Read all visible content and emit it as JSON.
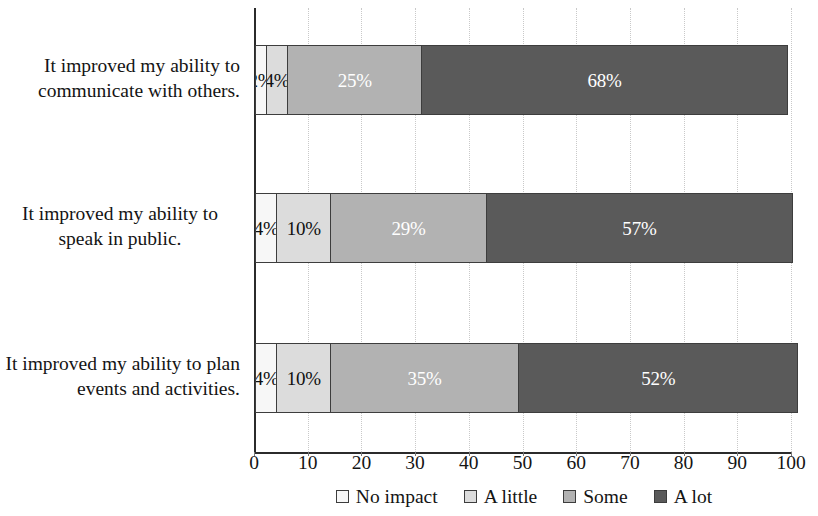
{
  "chart_data": {
    "type": "bar",
    "orientation": "horizontal",
    "stacked": true,
    "title": "",
    "subtitle": "",
    "xlabel": "",
    "ylabel": "",
    "xlim": [
      0,
      100
    ],
    "grid": true,
    "grid_axis": "x",
    "legend_position": "bottom",
    "categories": [
      "It improved my ability to communicate with others.",
      "It improved my ability to speak in public.",
      "It improved my ability to plan events and activities."
    ],
    "series": [
      {
        "name": "No impact",
        "values": [
          2,
          4,
          4
        ],
        "color": "#f7f7f7",
        "label_color": "#101010"
      },
      {
        "name": "A little",
        "values": [
          4,
          10,
          10
        ],
        "color": "#dcdcdc",
        "label_color": "#101010"
      },
      {
        "name": "Some",
        "values": [
          25,
          29,
          35
        ],
        "color": "#b2b2b2",
        "label_color": "#ffffff"
      },
      {
        "name": "A lot",
        "values": [
          68,
          57,
          52
        ],
        "color": "#5a5a5a",
        "label_color": "#ffffff"
      }
    ],
    "data_labels": [
      [
        "2%",
        "4%",
        "25%",
        "68%"
      ],
      [
        "4%",
        "10%",
        "29%",
        "57%"
      ],
      [
        "4%",
        "10%",
        "35%",
        "52%"
      ]
    ],
    "xticks": [
      0,
      10,
      20,
      30,
      40,
      50,
      60,
      70,
      80,
      90,
      100
    ],
    "xtick_labels": [
      "0",
      "10",
      "20",
      "30",
      "40",
      "50",
      "60",
      "70",
      "80",
      "90",
      "100"
    ]
  },
  "legend": {
    "items": [
      {
        "label": "No impact"
      },
      {
        "label": "A little"
      },
      {
        "label": "Some"
      },
      {
        "label": "A lot"
      }
    ]
  },
  "category_label_align": [
    "align-right",
    "align-center",
    "align-right"
  ]
}
